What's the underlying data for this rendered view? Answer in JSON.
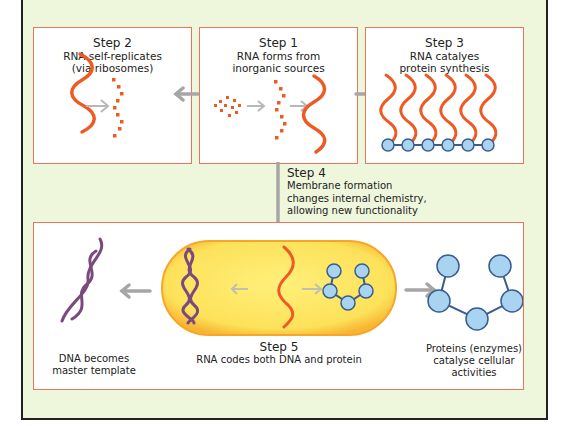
{
  "diagram": {
    "colors": {
      "background": "#eef6dc",
      "box_border": "#e8765a",
      "rna": "#ee5a24",
      "dna": "#7a4a7e",
      "protein_fill": "#a8d4f2",
      "protein_stroke": "#3a5d8a",
      "arrow": "#a6a6a6",
      "cell_fill": "#fde56b",
      "cell_border": "#f6a72a"
    },
    "step1": {
      "label": "Step 1",
      "line1": "RNA forms from",
      "line2": "inorganic sources"
    },
    "step2": {
      "label": "Step 2",
      "line1": "RNA self-replicates",
      "line2": "(via ribosomes)"
    },
    "step3": {
      "label": "Step 3",
      "line1": "RNA catalyes",
      "line2": "protein synthesis"
    },
    "step4": {
      "label": "Step 4",
      "line1": "Membrane formation",
      "line2": "changes internal chemistry,",
      "line3": "allowing new functionality"
    },
    "step5": {
      "label": "Step 5",
      "line1": "RNA codes both DNA and protein"
    },
    "dna_caption": {
      "line1": "DNA becomes",
      "line2": "master template"
    },
    "protein_caption": {
      "line1": "Proteins (enzymes)",
      "line2": "catalyse cellular",
      "line3": "activities"
    }
  }
}
